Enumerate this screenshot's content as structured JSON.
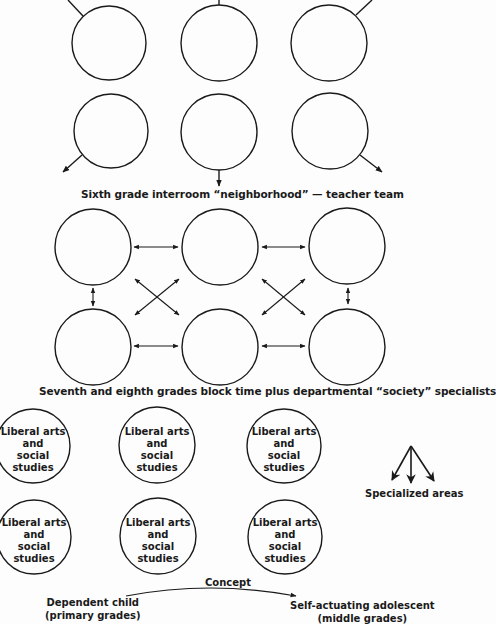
{
  "section1": {
    "caption": "Sixth grade interroom “neighborhood” — teacher team",
    "circles": 6
  },
  "section2": {
    "caption": "Seventh and eighth grades block time plus departmental “society” specialists",
    "circles": 6
  },
  "section3": {
    "circles": [
      {
        "line1": "Liberal arts",
        "line2": "and",
        "line3": "social studies"
      },
      {
        "line1": "Liberal arts",
        "line2": "and",
        "line3": "social studies"
      },
      {
        "line1": "Liberal arts",
        "line2": "and",
        "line3": "social studies"
      },
      {
        "line1": "Liberal arts",
        "line2": "and",
        "line3": "social studies"
      },
      {
        "line1": "Liberal arts",
        "line2": "and",
        "line3": "social studies"
      },
      {
        "line1": "Liberal arts",
        "line2": "and",
        "line3": "social studies"
      }
    ],
    "specialized_label": "Specialized areas"
  },
  "concept": {
    "title": "Concept",
    "from_line1": "Dependent child",
    "from_line2": "(primary grades)",
    "to_line1": "Self-actuating adolescent",
    "to_line2": "(middle grades)"
  }
}
